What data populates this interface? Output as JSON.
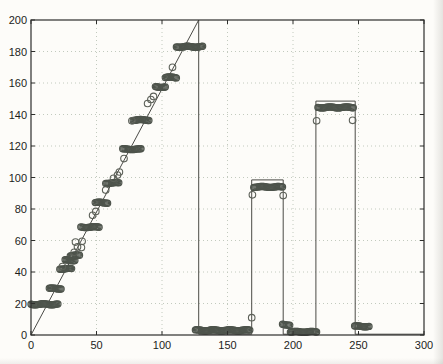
{
  "figure": {
    "background": "#fdfcf9",
    "axis_color": "#2e2e2c",
    "grid_color": "#c2cabe",
    "line_color": "#4a4a46",
    "cluster_marker_color": "#4e544c",
    "single_marker_color": "#5c6058",
    "tick_label_color": "#1c1c1c"
  },
  "chart_data": {
    "type": "scatter",
    "title": "",
    "xlabel": "",
    "ylabel": "",
    "xlim": [
      0,
      300
    ],
    "ylim": [
      0,
      200
    ],
    "x_ticks": [
      0,
      50,
      100,
      150,
      200,
      250,
      300
    ],
    "y_ticks": [
      0,
      20,
      40,
      60,
      80,
      100,
      120,
      140,
      160,
      180,
      200
    ],
    "grid": "dotted",
    "legend": "none",
    "line_series": {
      "name": "reference-signal-line",
      "points": [
        [
          0,
          0
        ],
        [
          128,
          200
        ],
        [
          128,
          0.5
        ],
        [
          168.5,
          0.5
        ],
        [
          168.5,
          98.5
        ],
        [
          192.5,
          98.5
        ],
        [
          192.5,
          0.5
        ],
        [
          217.5,
          0.5
        ],
        [
          217.5,
          148.5
        ],
        [
          247.5,
          148.5
        ],
        [
          247.5,
          0.5
        ],
        [
          300,
          0.5
        ]
      ]
    },
    "marker_clusters": [
      {
        "x_start": 0,
        "x_end": 20.5,
        "y": 19.5
      },
      {
        "x_start": 14,
        "x_end": 23,
        "y": 29.5
      },
      {
        "x_start": 22,
        "x_end": 31,
        "y": 42
      },
      {
        "x_start": 26,
        "x_end": 33.5,
        "y": 47.5
      },
      {
        "x_start": 30,
        "x_end": 37,
        "y": 50.5
      },
      {
        "x_start": 38,
        "x_end": 52,
        "y": 68.5
      },
      {
        "x_start": 49,
        "x_end": 58.5,
        "y": 84
      },
      {
        "x_start": 57,
        "x_end": 67,
        "y": 96.5
      },
      {
        "x_start": 70,
        "x_end": 84,
        "y": 118
      },
      {
        "x_start": 78,
        "x_end": 90,
        "y": 136.5
      },
      {
        "x_start": 95,
        "x_end": 102.5,
        "y": 157.5
      },
      {
        "x_start": 102.5,
        "x_end": 111,
        "y": 163.5
      },
      {
        "x_start": 111,
        "x_end": 131,
        "y": 183
      },
      {
        "x_start": 125.5,
        "x_end": 167,
        "y": 3
      },
      {
        "x_start": 170,
        "x_end": 192,
        "y": 94
      },
      {
        "x_start": 192,
        "x_end": 197.5,
        "y": 6.5
      },
      {
        "x_start": 198,
        "x_end": 218,
        "y": 2
      },
      {
        "x_start": 219,
        "x_end": 246,
        "y": 144.5
      },
      {
        "x_start": 247,
        "x_end": 258,
        "y": 5.5
      }
    ],
    "marker_points": [
      [
        24,
        43.5
      ],
      [
        33,
        52.5
      ],
      [
        35.5,
        56
      ],
      [
        38.5,
        55.5
      ],
      [
        39,
        59.5
      ],
      [
        34,
        59
      ],
      [
        47,
        76
      ],
      [
        49.5,
        78.5
      ],
      [
        57,
        92
      ],
      [
        63,
        99.5
      ],
      [
        66,
        101.5
      ],
      [
        67.5,
        103.5
      ],
      [
        71,
        112
      ],
      [
        77,
        136
      ],
      [
        89,
        147
      ],
      [
        91.5,
        149.5
      ],
      [
        93.5,
        151.5
      ],
      [
        108,
        170
      ],
      [
        168.5,
        11
      ],
      [
        169,
        89
      ],
      [
        192.5,
        88.5
      ],
      [
        218,
        136
      ],
      [
        245.5,
        136.3
      ]
    ]
  }
}
